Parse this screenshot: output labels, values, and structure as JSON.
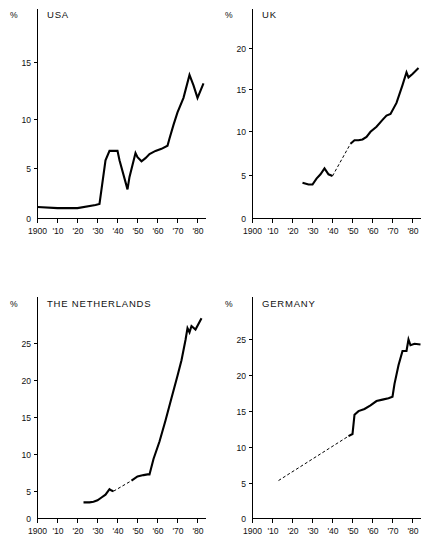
{
  "figure": {
    "unit_symbol": "%",
    "x_tick_labels": [
      "1900",
      "'10",
      "'20",
      "'30",
      "'40",
      "'50",
      "'60",
      "'70",
      "'80"
    ],
    "x_tick_years": [
      1900,
      1910,
      1920,
      1930,
      1940,
      1950,
      1960,
      1970,
      1980
    ],
    "line_color": "#000000",
    "background_color": "#ffffff"
  },
  "chart_data": [
    {
      "type": "line",
      "title": "USA",
      "xlabel": "",
      "ylabel": "%",
      "xlim": [
        1900,
        1986
      ],
      "ylim": [
        0,
        16.5
      ],
      "yticks": [
        0,
        5,
        10,
        15
      ],
      "ytick_labels": [
        "0",
        "5",
        "10",
        "15"
      ],
      "xticks": [
        1900,
        1910,
        1920,
        1930,
        1940,
        1950,
        1960,
        1970,
        1980
      ],
      "xtick_labels": [
        "1900",
        "'10",
        "'20",
        "'30",
        "'40",
        "'50",
        "'60",
        "'70",
        "'80"
      ],
      "grid": false,
      "legend": "none",
      "series": [
        {
          "name": "USA government expenditure share",
          "style": "solid",
          "x": [
            1900,
            1910,
            1920,
            1929,
            1931,
            1934,
            1936,
            1940,
            1941,
            1945,
            1946,
            1949,
            1950,
            1952,
            1954,
            1956,
            1959,
            1962,
            1965,
            1966,
            1968,
            1970,
            1973,
            1976,
            1978,
            1980,
            1983
          ],
          "y": [
            1.1,
            1.0,
            1.0,
            1.3,
            1.4,
            5.6,
            6.5,
            6.5,
            5.6,
            2.8,
            4.0,
            6.3,
            5.9,
            5.5,
            5.8,
            6.2,
            6.5,
            6.7,
            7.0,
            7.7,
            9.0,
            10.2,
            11.6,
            13.8,
            12.8,
            11.6,
            13.0
          ]
        }
      ]
    },
    {
      "type": "line",
      "title": "UK",
      "xlabel": "",
      "ylabel": "%",
      "xlim": [
        1900,
        1986
      ],
      "ylim": [
        0,
        22.5
      ],
      "yticks": [
        0,
        5,
        10,
        15,
        20
      ],
      "ytick_labels": [
        "0",
        "5",
        "10",
        "15",
        "20"
      ],
      "xticks": [
        1900,
        1910,
        1920,
        1930,
        1940,
        1950,
        1960,
        1970,
        1980
      ],
      "xtick_labels": [
        "1900",
        "'10",
        "'20",
        "'30",
        "'40",
        "'50",
        "'60",
        "'70",
        "'80"
      ],
      "grid": false,
      "legend": "none",
      "series": [
        {
          "name": "UK government expenditure share (observed early)",
          "style": "solid",
          "x": [
            1925,
            1928,
            1930,
            1932,
            1934,
            1936,
            1938,
            1940
          ],
          "y": [
            4.2,
            4.0,
            4.0,
            4.7,
            5.2,
            5.9,
            5.2,
            5.0
          ]
        },
        {
          "name": "UK government expenditure share (interpolated)",
          "style": "dashed",
          "x": [
            1940,
            1949
          ],
          "y": [
            5.0,
            8.8
          ]
        },
        {
          "name": "UK government expenditure share (observed late)",
          "style": "solid",
          "x": [
            1949,
            1951,
            1953,
            1955,
            1957,
            1959,
            1962,
            1965,
            1967,
            1969,
            1972,
            1975,
            1977,
            1978,
            1980,
            1983
          ],
          "y": [
            8.8,
            9.2,
            9.2,
            9.3,
            9.6,
            10.2,
            10.8,
            11.6,
            12.1,
            12.3,
            13.6,
            15.7,
            17.2,
            16.6,
            17.0,
            17.7
          ]
        }
      ]
    },
    {
      "type": "line",
      "title": "THE NETHERLANDS",
      "xlabel": "",
      "ylabel": "%",
      "xlim": [
        1900,
        1986
      ],
      "ylim": [
        0,
        29.5
      ],
      "yticks": [
        0,
        5,
        10,
        15,
        20,
        25
      ],
      "ytick_labels": [
        "0",
        "5",
        "10",
        "15",
        "20",
        "25"
      ],
      "xticks": [
        1900,
        1910,
        1920,
        1930,
        1940,
        1950,
        1960,
        1970,
        1980
      ],
      "xtick_labels": [
        "1900",
        "'10",
        "'20",
        "'30",
        "'40",
        "'50",
        "'60",
        "'70",
        "'80"
      ],
      "grid": false,
      "legend": "none",
      "series": [
        {
          "name": "Netherlands government expenditure share (observed early)",
          "style": "solid",
          "x": [
            1923,
            1926,
            1928,
            1930,
            1932,
            1934,
            1936,
            1937,
            1938
          ],
          "y": [
            2.3,
            2.3,
            2.4,
            2.6,
            3.0,
            3.4,
            4.2,
            4.0,
            3.9
          ]
        },
        {
          "name": "Netherlands government expenditure share (interpolated)",
          "style": "dashed",
          "x": [
            1938,
            1947
          ],
          "y": [
            3.9,
            5.4
          ]
        },
        {
          "name": "Netherlands government expenditure share (observed late)",
          "style": "solid",
          "x": [
            1947,
            1950,
            1953,
            1955,
            1956,
            1958,
            1961,
            1964,
            1967,
            1970,
            1972,
            1974,
            1975,
            1976,
            1977,
            1979,
            1982
          ],
          "y": [
            5.4,
            6.0,
            6.2,
            6.3,
            6.3,
            8.5,
            11.0,
            14.0,
            17.2,
            20.4,
            22.6,
            25.5,
            27.2,
            26.6,
            27.5,
            27.0,
            28.6
          ]
        }
      ]
    },
    {
      "type": "line",
      "title": "GERMANY",
      "xlabel": "",
      "ylabel": "%",
      "xlim": [
        1900,
        1986
      ],
      "ylim": [
        0,
        27.5
      ],
      "yticks": [
        0,
        5,
        10,
        15,
        20,
        25
      ],
      "ytick_labels": [
        "0",
        "5",
        "10",
        "15",
        "20",
        "25"
      ],
      "xticks": [
        1900,
        1910,
        1920,
        1930,
        1940,
        1950,
        1960,
        1970,
        1980
      ],
      "xtick_labels": [
        "1900",
        "'10",
        "'20",
        "'30",
        "'40",
        "'50",
        "'60",
        "'70",
        "'80"
      ],
      "grid": false,
      "legend": "none",
      "series": [
        {
          "name": "Germany government expenditure share (interpolated)",
          "style": "dashed",
          "x": [
            1913,
            1948
          ],
          "y": [
            5.3,
            11.5
          ]
        },
        {
          "name": "Germany government expenditure share (observed)",
          "style": "solid",
          "x": [
            1948,
            1950,
            1951,
            1953,
            1956,
            1959,
            1962,
            1965,
            1968,
            1970,
            1971,
            1973,
            1975,
            1977,
            1978,
            1979,
            1981,
            1984
          ],
          "y": [
            11.5,
            11.8,
            14.5,
            15.0,
            15.3,
            15.8,
            16.4,
            16.6,
            16.8,
            17.0,
            18.8,
            21.4,
            23.4,
            23.4,
            25.0,
            24.2,
            24.4,
            24.3
          ]
        }
      ]
    }
  ]
}
